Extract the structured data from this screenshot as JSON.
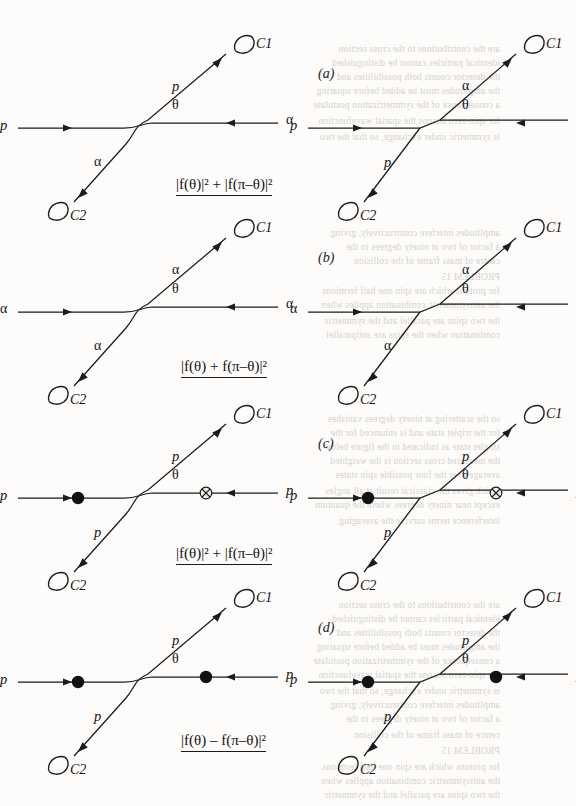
{
  "figure": {
    "background_color": "#fdfcfa",
    "ink_color": "#1b1b1b",
    "ghost_color": "#cfcbc6"
  },
  "panels": [
    {
      "id": "a",
      "label": "(a)",
      "formula": "|f(θ)|² + |f(π–θ)|²",
      "left_diagram": {
        "vertex_style": "bend",
        "in_left_label": "p",
        "in_right_label": "α",
        "out_up_label": "p",
        "out_down_label": "α",
        "angle_label": "θ",
        "detector_up_label": "C1",
        "detector_down_label": "C2",
        "markers": []
      },
      "right_diagram": {
        "vertex_style": "cross",
        "in_left_label": "p",
        "in_right_label": "α",
        "out_up_label": "α",
        "out_down_label": "p",
        "angle_label": "θ",
        "detector_up_label": "C1",
        "detector_down_label": "C2",
        "markers": []
      }
    },
    {
      "id": "b",
      "label": "(b)",
      "formula": "|f(θ) + f(π–θ)|²",
      "left_diagram": {
        "vertex_style": "bend",
        "in_left_label": "α",
        "in_right_label": "α",
        "out_up_label": "α",
        "out_down_label": "α",
        "angle_label": "θ",
        "detector_up_label": "C1",
        "detector_down_label": "C2",
        "markers": []
      },
      "right_diagram": {
        "vertex_style": "cross",
        "in_left_label": "α",
        "in_right_label": "α",
        "out_up_label": "α",
        "out_down_label": "α",
        "angle_label": "θ",
        "detector_up_label": "C1",
        "detector_down_label": "C2",
        "markers": []
      }
    },
    {
      "id": "c",
      "label": "(c)",
      "formula": "|f(θ)|² + |f(π–θ)|²",
      "left_diagram": {
        "vertex_style": "bend",
        "in_left_label": "p",
        "in_right_label": "p",
        "out_up_label": "p",
        "out_down_label": "p",
        "angle_label": "θ",
        "detector_up_label": "C1",
        "detector_down_label": "C2",
        "markers": [
          "spin-up-filled-dot",
          "spin-down-crossed-circle"
        ]
      },
      "right_diagram": {
        "vertex_style": "cross",
        "in_left_label": "p",
        "in_right_label": "p",
        "out_up_label": "p",
        "out_down_label": "p",
        "angle_label": "θ",
        "detector_up_label": "C1",
        "detector_down_label": "C2",
        "markers": [
          "spin-up-filled-dot",
          "spin-down-crossed-circle"
        ]
      }
    },
    {
      "id": "d",
      "label": "(d)",
      "formula": "|f(θ) – f(π–θ)|²",
      "left_diagram": {
        "vertex_style": "bend",
        "in_left_label": "p",
        "in_right_label": "p",
        "out_up_label": "p",
        "out_down_label": "p",
        "angle_label": "θ",
        "detector_up_label": "C1",
        "detector_down_label": "C2",
        "markers": [
          "spin-up-filled-dot",
          "spin-up-filled-dot"
        ]
      },
      "right_diagram": {
        "vertex_style": "cross",
        "in_left_label": "p",
        "in_right_label": "p",
        "out_up_label": "p",
        "out_down_label": "p",
        "angle_label": "θ",
        "detector_up_label": "C1",
        "detector_down_label": "C2",
        "markers": [
          "spin-up-filled-dot",
          "spin-up-filled-dot"
        ]
      }
    }
  ],
  "ghost_text": [
    "are the contributions to the cross section",
    "identical particles cannot be distinguished",
    "the detector counts both possibilities and",
    "the amplitudes must be added before squaring",
    "a consequence of the symmetrization postulate",
    "for spin-zero bosons the spatial wavefunction",
    "is symmetric under exchange, so that the two",
    "amplitudes interfere constructively, giving",
    "a factor of two at ninety degrees in the",
    "centre of mass frame of the collision",
    "PROBLEM 15",
    "for protons which are spin one half fermions",
    "the antisymmetric combination applies when",
    "the two spins are parallel and the symmetric",
    "combination when the spins are antiparallel",
    "so the scattering at ninety degrees vanishes",
    "for the triplet state and is enhanced for the",
    "singlet state as indicated in the figure below",
    "the measured cross section is the weighted",
    "average over the four possible spin states",
    "which gives the classical result at all angles",
    "except near ninety degrees where the quantum",
    "interference terms survive the averaging"
  ]
}
